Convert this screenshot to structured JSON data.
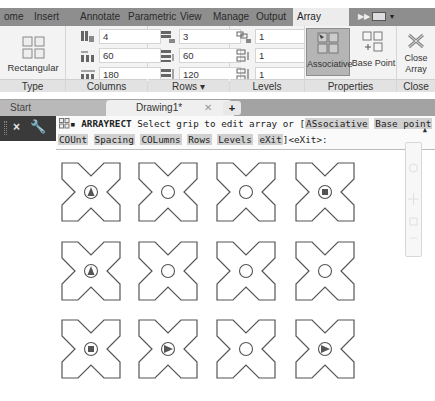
{
  "ribbon": {
    "tabs": [
      {
        "label": "ome",
        "active": false
      },
      {
        "label": "Insert",
        "active": false
      },
      {
        "label": "Annotate",
        "active": false
      },
      {
        "label": "Parametric",
        "active": false
      },
      {
        "label": "View",
        "active": false
      },
      {
        "label": "Manage",
        "active": false
      },
      {
        "label": "Output",
        "active": false
      },
      {
        "label": "Array Creation",
        "active": true
      }
    ],
    "panels": {
      "type": {
        "title": "Type",
        "button_label": "Rectangular"
      },
      "columns": {
        "title": "Columns",
        "fields": [
          {
            "name": "columns-count",
            "value": "4"
          },
          {
            "name": "column-between",
            "value": "60"
          },
          {
            "name": "column-total",
            "value": "180"
          }
        ]
      },
      "rows": {
        "title": "Rows ▾",
        "fields": [
          {
            "name": "rows-count",
            "value": "3"
          },
          {
            "name": "row-between",
            "value": "60"
          },
          {
            "name": "row-total",
            "value": "120"
          }
        ]
      },
      "levels": {
        "title": "Levels",
        "fields": [
          {
            "name": "levels-count",
            "value": "1"
          },
          {
            "name": "level-between",
            "value": "1"
          },
          {
            "name": "level-total",
            "value": "1"
          }
        ]
      },
      "properties": {
        "title": "Properties",
        "associative_label": "Associative",
        "base_point_label": "Base Point"
      },
      "close": {
        "title": "Close",
        "close_line1": "Close",
        "close_line2": "Array"
      }
    }
  },
  "document_tabs": {
    "start_label": "Start",
    "current_label": "Drawing1*",
    "close_glyph": "✕",
    "new_tab_glyph": "+"
  },
  "command_line": {
    "command": "ARRAYRECT",
    "prompt_text": " Select grip to edit array or [",
    "options_line1": [
      "ASsociative",
      "Base point"
    ],
    "options_line2": [
      "COUnt",
      "Spacing",
      "COLumns",
      "Rows",
      "Levels",
      "eXit"
    ],
    "default_text": "]<eXit>:"
  },
  "drawing": {
    "grid": [
      [
        "triangle-up",
        "circle",
        "circle",
        "square"
      ],
      [
        "triangle-up",
        "circle",
        "circle",
        "circle"
      ],
      [
        "square",
        "triangle-right",
        "circle",
        "triangle-right"
      ]
    ]
  },
  "colors": {
    "tabbar_bg": "#8e8e8e",
    "ribbon_bg": "#f3f3f3",
    "active_button_bg": "#b5b5b5",
    "command_bar_bg": "#3a3a3a",
    "shape_stroke": "#555555"
  }
}
